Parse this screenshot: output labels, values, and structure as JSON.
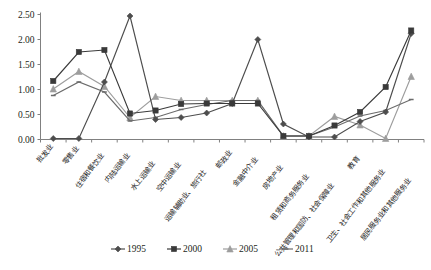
{
  "chart_data": {
    "type": "line",
    "title": "",
    "xlabel": "",
    "ylabel": "",
    "ylim": [
      0,
      2.5
    ],
    "ytick_step": 0.5,
    "ytick_labels": [
      "0.00",
      "0.50",
      "1.00",
      "1.50",
      "2.00",
      "2.50"
    ],
    "grid": false,
    "legend_position": "bottom",
    "categories": [
      "批发业",
      "零售业",
      "住宿和餐饮业",
      "内陆运输业",
      "水上运输业",
      "空中运输业",
      "运输辅助业、旅行社",
      "邮政业",
      "金融中介业",
      "房地产业",
      "租赁和商务服务业",
      "公共管理和国防、社会保障业",
      "教育",
      "卫生、社会工作和其他服务业",
      "居民服务业和其他服务业"
    ],
    "series": [
      {
        "name": "1995",
        "marker": "diamond",
        "color": "#4d4d4d",
        "values": [
          0.02,
          0.02,
          1.15,
          2.47,
          0.4,
          0.44,
          0.53,
          0.72,
          2.0,
          0.31,
          0.05,
          0.05,
          0.36,
          0.55,
          2.12
        ]
      },
      {
        "name": "2000",
        "marker": "square",
        "color": "#3a3a3a",
        "values": [
          1.17,
          1.75,
          1.79,
          0.52,
          0.58,
          0.71,
          0.72,
          0.72,
          0.72,
          0.07,
          0.07,
          0.28,
          0.55,
          1.05,
          2.18
        ]
      },
      {
        "name": "2005",
        "marker": "triangle",
        "color": "#9d9d9d",
        "values": [
          1.01,
          1.36,
          1.06,
          0.44,
          0.86,
          0.78,
          0.78,
          0.78,
          0.78,
          0.07,
          0.07,
          0.46,
          0.29,
          0.02,
          1.26
        ]
      },
      {
        "name": "2011",
        "marker": "line",
        "color": "#6b6b6b",
        "values": [
          0.88,
          1.15,
          0.95,
          0.37,
          0.44,
          0.6,
          0.7,
          0.78,
          0.78,
          0.07,
          0.07,
          0.25,
          0.47,
          0.58,
          0.8
        ]
      }
    ],
    "legend": [
      {
        "label": "1995",
        "marker": "diamond",
        "color": "#4d4d4d"
      },
      {
        "label": "2000",
        "marker": "square",
        "color": "#3a3a3a"
      },
      {
        "label": "2005",
        "marker": "triangle",
        "color": "#9d9d9d"
      },
      {
        "label": "2011",
        "marker": "line",
        "color": "#6b6b6b"
      }
    ]
  }
}
